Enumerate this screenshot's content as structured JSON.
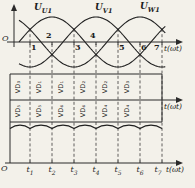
{
  "chart_data": {
    "type": "line",
    "axes": {
      "origin_label": "O",
      "time_label": "t(ωt)"
    },
    "series": [
      {
        "name": "U-U1",
        "label_base": "U",
        "label_sub": "U1",
        "amplitude": 1,
        "phase_deg": 0
      },
      {
        "name": "U-V1",
        "label_base": "U",
        "label_sub": "V1",
        "amplitude": 1,
        "phase_deg": -120
      },
      {
        "name": "U-W1",
        "label_base": "U",
        "label_sub": "W1",
        "amplitude": 1,
        "phase_deg": 120
      }
    ],
    "x_axis": {
      "tick_degrees": [
        30,
        90,
        150,
        210,
        270,
        330,
        390
      ],
      "tick_labels": [
        {
          "base": "t",
          "sub": "1"
        },
        {
          "base": "t",
          "sub": "2"
        },
        {
          "base": "t",
          "sub": "3"
        },
        {
          "base": "t",
          "sub": "4"
        },
        {
          "base": "t",
          "sub": "5"
        },
        {
          "base": "t",
          "sub": "6"
        },
        {
          "base": "t",
          "sub": "7"
        }
      ]
    },
    "commutation_points": [
      "1",
      "2",
      "3",
      "4",
      "5",
      "6",
      "7"
    ],
    "conduction": {
      "row1": [
        "VD₃",
        "VD₁",
        "VD₁",
        "VD₂",
        "VD₂",
        "VD₃"
      ],
      "row2": [
        "VD₅",
        "VD₅",
        "VD₆",
        "VD₆",
        "VD₄",
        "VD₄"
      ]
    },
    "output_ripple": {
      "shape": "six-pulse envelope",
      "cusps_at_tick_degrees": true
    }
  }
}
